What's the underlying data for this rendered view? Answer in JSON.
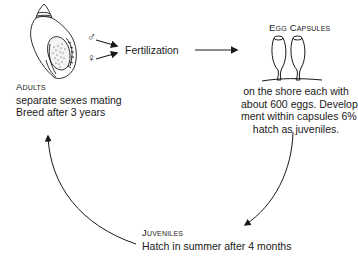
{
  "diagram": {
    "type": "life-cycle",
    "stages": {
      "adults": {
        "title": "Adults",
        "lines": [
          "separate sexes mating",
          "Breed after 3 years"
        ],
        "icon": "whelk-shell"
      },
      "fertilization": {
        "label": "Fertilization",
        "inputs": [
          {
            "symbol": "♂",
            "meaning": "male"
          },
          {
            "symbol": "♀",
            "meaning": "female"
          }
        ]
      },
      "egg_capsules": {
        "title": "Egg Capsules",
        "lines": [
          "on the shore each with",
          "about 600 eggs.  Develop-",
          "ment within capsules 6%",
          "hatch as juveniles."
        ],
        "icon": "egg-capsules"
      },
      "juveniles": {
        "title": "Juveniles",
        "lines": [
          "Hatch in summer after 4 months"
        ]
      }
    },
    "colors": {
      "ink": "#1a1a1a",
      "background": "#ffffff"
    }
  }
}
